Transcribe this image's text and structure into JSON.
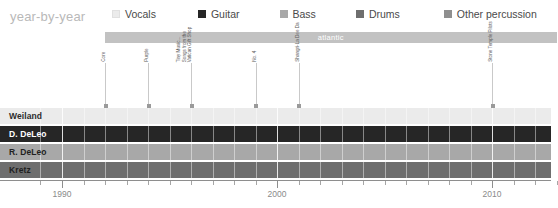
{
  "header": {
    "title": "year-by-year"
  },
  "legend": {
    "items": [
      {
        "label": "Vocals",
        "color": "#ebebeb",
        "icon": "square-swatch-icon"
      },
      {
        "label": "Guitar",
        "color": "#262626",
        "icon": "square-swatch-icon"
      },
      {
        "label": "Bass",
        "color": "#a8a8a8",
        "icon": "square-swatch-icon"
      },
      {
        "label": "Drums",
        "color": "#6e6e6e",
        "icon": "square-swatch-icon"
      },
      {
        "label": "Other percussion",
        "color": "#8f8f8f",
        "icon": "square-swatch-icon"
      }
    ]
  },
  "period_band": {
    "label": "atlantic",
    "start_year": 1992,
    "end_year": 2013,
    "color": "#c2c2c2",
    "text_color": "#ffffff"
  },
  "chart_data": {
    "type": "timeline",
    "title": "year-by-year",
    "xlabel": "",
    "ylabel": "",
    "xlim": [
      1989,
      2013
    ],
    "grid": true,
    "legend_position": "top",
    "axis": {
      "major_ticks": [
        1990,
        2000,
        2010
      ],
      "major_tick_labels": [
        "1990",
        "2000",
        "2010"
      ],
      "minor_tick_step": 1,
      "minor_tick_range": [
        1989,
        2013
      ]
    },
    "categories": [
      "Weiland",
      "D. DeLeo",
      "R. DeLeo",
      "Kretz"
    ],
    "series": [
      {
        "name": "Weiland",
        "role": "Vocals",
        "color": "#ebebeb",
        "text_color": "#2b2b2b",
        "start_year": 1989,
        "end_year": 2013
      },
      {
        "name": "D. DeLeo",
        "role": "Guitar",
        "color": "#262626",
        "text_color": "#ffffff",
        "start_year": 1989,
        "end_year": 2013
      },
      {
        "name": "R. DeLeo",
        "role": "Bass",
        "color": "#a8a8a8",
        "text_color": "#1f1f1f",
        "start_year": 1989,
        "end_year": 2013
      },
      {
        "name": "Kretz",
        "role": "Drums",
        "color": "#6e6e6e",
        "text_color": "#1f1f1f",
        "start_year": 1989,
        "end_year": 2013
      }
    ],
    "releases": [
      {
        "label": "Core",
        "lines": [
          "Core"
        ],
        "year": 1992
      },
      {
        "label": "Purple",
        "lines": [
          "Purple"
        ],
        "year": 1994
      },
      {
        "label": "Tiny Music... Songs from the Vatican Gift Shop",
        "lines": [
          "Tiny Music...",
          "Songs from the",
          "Vatican Gift Shop"
        ],
        "year": 1996
      },
      {
        "label": "No. 4",
        "lines": [
          "No. 4"
        ],
        "year": 1999
      },
      {
        "label": "Shangri-La Dee Da",
        "lines": [
          "Shangri-La Dee Da"
        ],
        "year": 2001
      },
      {
        "label": "Stone Temple Pilots",
        "lines": [
          "Stone Temple Pilots"
        ],
        "year": 2010
      }
    ]
  }
}
